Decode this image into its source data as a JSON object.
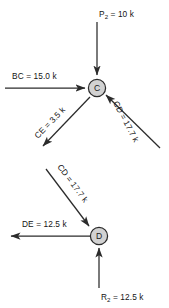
{
  "figure": {
    "background_color": "#ffffff",
    "line_color": "#2b2b2b",
    "node_fill_color": "#d2d2d2",
    "node_stroke_color": "#2b2b2b",
    "text_color": "#141414",
    "width": 169,
    "height": 308
  },
  "joint_c": {
    "node_label": "C",
    "forces": {
      "p2": {
        "name": "P",
        "subscript": "2",
        "equals": " = 10 k",
        "full_text": "P2 = 10 k",
        "magnitude": 10,
        "unit": "k",
        "direction": "down-into-joint"
      },
      "bc": {
        "full_text": "BC = 15.0 k",
        "magnitude": 15.0,
        "unit": "k",
        "direction": "right-into-joint"
      },
      "ce": {
        "full_text": "CE = 3.5 k",
        "magnitude": 3.5,
        "unit": "k",
        "direction": "down-left-away-from-joint"
      },
      "cd": {
        "full_text": "CD = 17.7 k",
        "magnitude": 17.7,
        "unit": "k",
        "direction": "up-left-into-joint"
      }
    }
  },
  "joint_d": {
    "node_label": "D",
    "forces": {
      "cd": {
        "full_text": "CD = 17.7 k",
        "magnitude": 17.7,
        "unit": "k",
        "direction": "down-right-into-joint"
      },
      "de": {
        "full_text": "DE = 12.5 k",
        "magnitude": 12.5,
        "unit": "k",
        "direction": "left-away-from-joint"
      },
      "r2": {
        "name": "R",
        "subscript": "2",
        "equals": " = 12.5 k",
        "full_text": "R2 = 12.5 k",
        "magnitude": 12.5,
        "unit": "k",
        "direction": "up-into-joint"
      }
    }
  }
}
